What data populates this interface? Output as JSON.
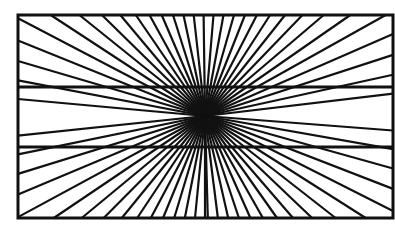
{
  "figure": {
    "stroke_color": "#111111",
    "background": "#ffffff",
    "box": {
      "left": 18,
      "top": 15,
      "right": 393,
      "bottom": 218,
      "stroke_width": 3
    },
    "center": {
      "x": 205,
      "y": 116
    },
    "horizontal_lines": [
      {
        "y": 87,
        "stroke_width": 3
      },
      {
        "y": 147,
        "stroke_width": 3
      }
    ],
    "rays": {
      "angle_step_deg": 5.6,
      "stroke_width": 2.2,
      "min_angle_from_horizontal_deg": 4
    }
  }
}
